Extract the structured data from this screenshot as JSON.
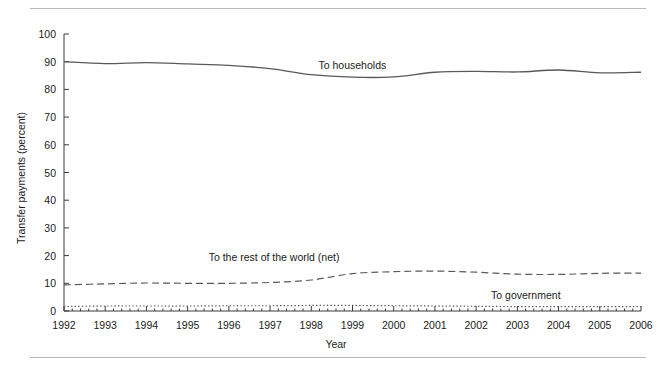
{
  "figure": {
    "has_top_rule": true,
    "has_bottom_rule": true,
    "rule_color": "#b9b9b9",
    "background": "#ffffff"
  },
  "chart_data": {
    "type": "line",
    "title": "",
    "xlabel": "Year",
    "ylabel": "Transfer payments (percent)",
    "xlim": [
      1992,
      2006
    ],
    "ylim": [
      0,
      100
    ],
    "ytick_labels": [
      "0",
      "10",
      "20",
      "30",
      "40",
      "50",
      "60",
      "70",
      "80",
      "90",
      "100"
    ],
    "yticks": [
      0,
      10,
      20,
      30,
      40,
      50,
      60,
      70,
      80,
      90,
      100
    ],
    "grid": false,
    "legend": "inline-annotations",
    "x": [
      1992,
      1993,
      1994,
      1995,
      1996,
      1997,
      1998,
      1999,
      2000,
      2001,
      2002,
      2003,
      2004,
      2005,
      2006
    ],
    "xtick_labels": [
      "1992",
      "1993",
      "1994",
      "1995",
      "1996",
      "1997",
      "1998",
      "1999",
      "2000",
      "2001",
      "2002",
      "2003",
      "2004",
      "2005",
      "2006"
    ],
    "series": [
      {
        "name": "To households",
        "label": "To households",
        "style": "solid",
        "color": "#595959",
        "label_x": 1999.0,
        "label_y": 88.5,
        "values": [
          90.0,
          89.3,
          89.7,
          89.2,
          88.7,
          87.5,
          85.3,
          84.4,
          84.5,
          86.2,
          86.5,
          86.3,
          87.0,
          86.0,
          86.2
        ]
      },
      {
        "name": "To the rest of the world (net)",
        "label": "To the rest of the world (net)",
        "style": "dashed",
        "color": "#595959",
        "label_x": 1997.1,
        "label_y": 19.0,
        "values": [
          9.4,
          9.8,
          10.1,
          10.0,
          10.0,
          10.3,
          11.2,
          13.5,
          14.2,
          14.4,
          14.0,
          13.3,
          13.2,
          13.6,
          13.7
        ]
      },
      {
        "name": "To government",
        "label": "To government",
        "style": "dotted",
        "color": "#595959",
        "label_x": 2003.2,
        "label_y": 5.4,
        "values": [
          1.6,
          1.8,
          1.8,
          1.8,
          1.9,
          1.9,
          2.0,
          2.0,
          1.9,
          1.8,
          1.7,
          1.6,
          1.6,
          1.6,
          1.6
        ]
      }
    ],
    "axis_color": "#3a3a3a",
    "minor_ticks_per_interval": 4
  }
}
